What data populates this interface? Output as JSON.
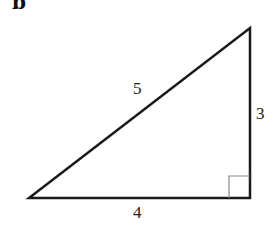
{
  "panel_label": "b",
  "triangle": {
    "vertices": {
      "bottom_left": [
        29,
        198
      ],
      "bottom_right": [
        250,
        198
      ],
      "top_right": [
        250,
        28
      ]
    },
    "sides": {
      "hypotenuse": "5",
      "vertical": "3",
      "base": "4"
    },
    "right_angle_marker": true,
    "stroke_color": "#1a1a1a",
    "marker_color": "#888888"
  }
}
